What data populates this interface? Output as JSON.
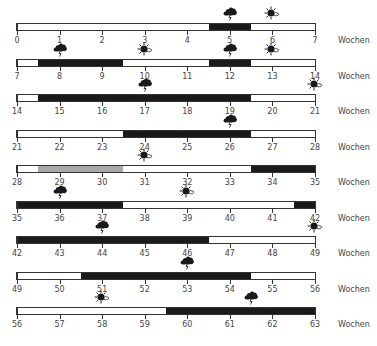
{
  "unit_label": "Wochen",
  "colors": {
    "dark": "#1a1a1a",
    "gray": "#a8a8a8",
    "outline": "#333333"
  },
  "chart_data": {
    "type": "timeline",
    "xlabel": "Wochen",
    "weeks_per_row": 7,
    "rows": [
      {
        "start": 0,
        "end": 7,
        "ticks": [
          "0",
          "1",
          "2",
          "3",
          "4",
          "5",
          "6",
          "7"
        ],
        "segments": [
          {
            "from": 4.5,
            "to": 5.5,
            "fill": "dark"
          }
        ],
        "icons": [
          {
            "type": "storm-cloud",
            "at": 5
          },
          {
            "type": "sun",
            "at": 6
          }
        ]
      },
      {
        "start": 7,
        "end": 14,
        "ticks": [
          "7",
          "8",
          "9",
          "10",
          "11",
          "12",
          "13",
          "14"
        ],
        "segments": [
          {
            "from": 7.5,
            "to": 9.5,
            "fill": "dark"
          },
          {
            "from": 11.5,
            "to": 12.5,
            "fill": "dark"
          }
        ],
        "icons": [
          {
            "type": "storm-cloud",
            "at": 8
          },
          {
            "type": "sun",
            "at": 10
          },
          {
            "type": "storm-cloud",
            "at": 12
          },
          {
            "type": "sun",
            "at": 13
          }
        ]
      },
      {
        "start": 14,
        "end": 21,
        "ticks": [
          "14",
          "15",
          "16",
          "17",
          "18",
          "19",
          "20",
          "21"
        ],
        "segments": [
          {
            "from": 14.5,
            "to": 19.5,
            "fill": "dark"
          }
        ],
        "icons": [
          {
            "type": "storm-cloud",
            "at": 17
          },
          {
            "type": "sun",
            "at": 21
          }
        ]
      },
      {
        "start": 21,
        "end": 28,
        "ticks": [
          "21",
          "22",
          "23",
          "24",
          "25",
          "26",
          "27",
          "28"
        ],
        "segments": [
          {
            "from": 23.5,
            "to": 26.5,
            "fill": "dark"
          }
        ],
        "icons": [
          {
            "type": "storm-cloud",
            "at": 26
          }
        ]
      },
      {
        "start": 28,
        "end": 35,
        "ticks": [
          "28",
          "29",
          "30",
          "31",
          "32",
          "33",
          "34",
          "35"
        ],
        "segments": [
          {
            "from": 28.5,
            "to": 30.5,
            "fill": "gray"
          },
          {
            "from": 33.5,
            "to": 35,
            "fill": "dark"
          }
        ],
        "icons": [
          {
            "type": "sun",
            "at": 31
          }
        ]
      },
      {
        "start": 35,
        "end": 42,
        "ticks": [
          "35",
          "36",
          "37",
          "38",
          "39",
          "40",
          "41",
          "42"
        ],
        "segments": [
          {
            "from": 35,
            "to": 37.5,
            "fill": "dark"
          },
          {
            "from": 41.5,
            "to": 42,
            "fill": "dark"
          }
        ],
        "icons": [
          {
            "type": "storm-cloud",
            "at": 36
          },
          {
            "type": "sun",
            "at": 39
          }
        ]
      },
      {
        "start": 42,
        "end": 49,
        "ticks": [
          "42",
          "43",
          "44",
          "45",
          "46",
          "47",
          "48",
          "49"
        ],
        "segments": [
          {
            "from": 42,
            "to": 46.5,
            "fill": "dark"
          }
        ],
        "icons": [
          {
            "type": "storm-cloud",
            "at": 44
          },
          {
            "type": "sun",
            "at": 49
          }
        ]
      },
      {
        "start": 49,
        "end": 56,
        "ticks": [
          "49",
          "50",
          "51",
          "52",
          "53",
          "54",
          "55",
          "56"
        ],
        "segments": [
          {
            "from": 50.5,
            "to": 54.5,
            "fill": "dark"
          }
        ],
        "icons": [
          {
            "type": "storm-cloud",
            "at": 53
          }
        ]
      },
      {
        "start": 56,
        "end": 63,
        "ticks": [
          "56",
          "57",
          "58",
          "59",
          "60",
          "61",
          "62",
          "63"
        ],
        "segments": [
          {
            "from": 59.5,
            "to": 63,
            "fill": "dark"
          }
        ],
        "icons": [
          {
            "type": "sun",
            "at": 58
          },
          {
            "type": "storm-cloud",
            "at": 61.5
          }
        ]
      }
    ]
  }
}
